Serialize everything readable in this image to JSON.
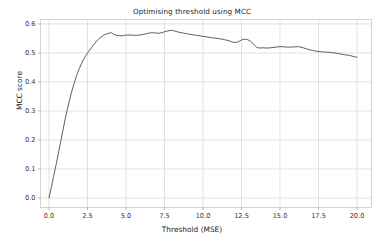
{
  "figure": {
    "background_color": "#ffffff",
    "width": 384,
    "height": 244
  },
  "chart_data": {
    "type": "line",
    "title": "Optimising threshold using MCC",
    "xlabel": "Threshold (MSE)",
    "ylabel": "MCC score",
    "xlim": [
      -0.9,
      20.9
    ],
    "ylim": [
      -0.03,
      0.625
    ],
    "xticks": [
      "0.0",
      "2.5",
      "5.0",
      "7.5",
      "10.0",
      "12.5",
      "15.0",
      "17.5",
      "20.0"
    ],
    "xtick_values": [
      0.0,
      2.5,
      5.0,
      7.5,
      10.0,
      12.5,
      15.0,
      17.5,
      20.0
    ],
    "yticks": [
      "0.0",
      "0.1",
      "0.2",
      "0.3",
      "0.4",
      "0.5",
      "0.6"
    ],
    "ytick_values": [
      0.0,
      0.1,
      0.2,
      0.3,
      0.4,
      0.5,
      0.6
    ],
    "grid": true,
    "grid_color": "#d6d6d6",
    "legend": null,
    "line_color": "#4d4d4d",
    "line_width": 0.9,
    "series": [
      {
        "name": "MCC score",
        "x": [
          0.0,
          0.15,
          0.3,
          0.45,
          0.6,
          0.75,
          0.9,
          1.05,
          1.2,
          1.35,
          1.5,
          1.65,
          1.8,
          1.95,
          2.1,
          2.25,
          2.4,
          2.55,
          2.7,
          2.85,
          3.0,
          3.15,
          3.3,
          3.45,
          3.6,
          3.75,
          3.9,
          4.0,
          4.15,
          4.3,
          4.5,
          4.7,
          4.9,
          5.1,
          5.3,
          5.5,
          5.7,
          5.9,
          6.1,
          6.3,
          6.5,
          6.7,
          6.9,
          7.1,
          7.3,
          7.5,
          7.7,
          7.9,
          8.0,
          8.2,
          8.4,
          8.6,
          8.8,
          9.0,
          9.3,
          9.6,
          9.9,
          10.2,
          10.5,
          10.8,
          11.1,
          11.4,
          11.7,
          11.9,
          12.1,
          12.3,
          12.5,
          12.7,
          12.9,
          13.1,
          13.3,
          13.5,
          13.7,
          13.9,
          14.1,
          14.4,
          14.7,
          15.0,
          15.3,
          15.6,
          15.9,
          16.2,
          16.5,
          16.8,
          17.1,
          17.4,
          17.7,
          18.0,
          18.3,
          18.6,
          18.9,
          19.2,
          19.5,
          19.7,
          19.9,
          20.0
        ],
        "y": [
          0.0,
          0.036,
          0.075,
          0.112,
          0.152,
          0.192,
          0.232,
          0.272,
          0.308,
          0.341,
          0.372,
          0.399,
          0.423,
          0.444,
          0.462,
          0.478,
          0.492,
          0.503,
          0.514,
          0.525,
          0.535,
          0.544,
          0.552,
          0.558,
          0.563,
          0.566,
          0.568,
          0.571,
          0.566,
          0.562,
          0.56,
          0.559,
          0.561,
          0.562,
          0.562,
          0.561,
          0.561,
          0.562,
          0.564,
          0.566,
          0.569,
          0.57,
          0.569,
          0.568,
          0.57,
          0.573,
          0.576,
          0.578,
          0.578,
          0.575,
          0.572,
          0.57,
          0.568,
          0.566,
          0.563,
          0.561,
          0.558,
          0.556,
          0.553,
          0.551,
          0.549,
          0.546,
          0.542,
          0.538,
          0.536,
          0.539,
          0.545,
          0.548,
          0.546,
          0.54,
          0.53,
          0.519,
          0.517,
          0.518,
          0.517,
          0.518,
          0.52,
          0.522,
          0.521,
          0.52,
          0.521,
          0.522,
          0.518,
          0.513,
          0.509,
          0.506,
          0.504,
          0.503,
          0.502,
          0.5,
          0.497,
          0.494,
          0.492,
          0.489,
          0.486,
          0.486
        ]
      }
    ],
    "annotations": []
  }
}
